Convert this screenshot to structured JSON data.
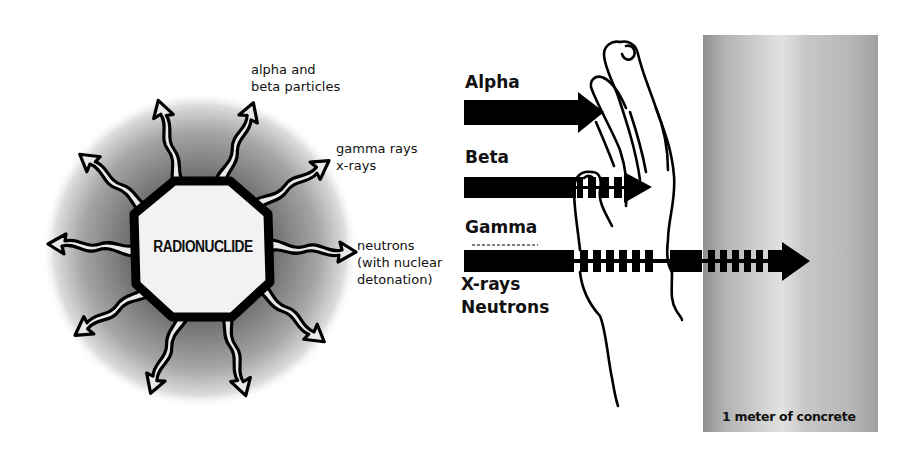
{
  "left_panel": {
    "title": "Radionuclide emissions",
    "nucleus_label": "RADIONUCLIDE",
    "emission_labels": [
      {
        "id": "alpha-beta",
        "lines": [
          "alpha and",
          "beta particles"
        ]
      },
      {
        "id": "gamma-x",
        "lines": [
          "gamma rays",
          "x-rays"
        ]
      },
      {
        "id": "neutrons",
        "lines": [
          "neutrons",
          "(with nuclear",
          "detonation)"
        ]
      }
    ],
    "ray_count": 10
  },
  "right_panel": {
    "title": "Penetration of radiation",
    "rows": [
      {
        "id": "alpha",
        "label": "Alpha",
        "stopped_by": "skin / hand"
      },
      {
        "id": "beta",
        "label": "Beta",
        "stopped_by": "hand"
      },
      {
        "id": "gamma",
        "label": "Gamma",
        "sublabels": [
          "X-rays",
          "Neutrons"
        ],
        "stopped_by": "concrete"
      }
    ],
    "barrier": {
      "label": "1 meter of concrete"
    }
  },
  "colors": {
    "ink": "#000000",
    "halo_dark": "#6e6e6e",
    "halo_light": "#ffffff",
    "nucleus_fill": "#f2f2f2",
    "concrete_edge": "#a8a8a8",
    "concrete_mid": "#d6d6d6"
  }
}
